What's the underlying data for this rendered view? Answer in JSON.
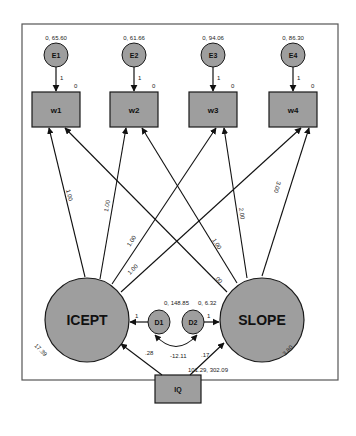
{
  "diagram": {
    "type": "structural-equation-model (latent growth curve)",
    "colors": {
      "node_fill": "#9e9e9e",
      "stroke": "#1a1a1a",
      "frame": "#555555",
      "background": "#ffffff"
    },
    "error_terms": [
      {
        "id": "E1",
        "label": "E1",
        "estimate": "0, 65.60",
        "path_label": "1",
        "intercept": "0"
      },
      {
        "id": "E2",
        "label": "E2",
        "estimate": "0, 61.66",
        "path_label": "1",
        "intercept": "0"
      },
      {
        "id": "E3",
        "label": "E3",
        "estimate": "0, 94.06",
        "path_label": "1",
        "intercept": "0"
      },
      {
        "id": "E4",
        "label": "E4",
        "estimate": "0, 86.30",
        "path_label": "1",
        "intercept": "0"
      }
    ],
    "observed": [
      {
        "id": "w1",
        "label": "w1"
      },
      {
        "id": "w2",
        "label": "w2"
      },
      {
        "id": "w3",
        "label": "w3"
      },
      {
        "id": "w4",
        "label": "w4"
      }
    ],
    "latent": {
      "icept": {
        "label": "ICEPT",
        "intercept": "17.39"
      },
      "slope": {
        "label": "SLOPE",
        "intercept": "3.80"
      }
    },
    "loadings": {
      "icept_w1": "1.00",
      "icept_w2": "1.00",
      "icept_w3": "1.00",
      "icept_w4": "1.00",
      "slope_w1": ".00",
      "slope_w2": "1.00",
      "slope_w3": "2.00",
      "slope_w4": "3.00"
    },
    "disturbances": {
      "d1": {
        "label": "D1",
        "estimate": "0, 148.85",
        "path_label": "1"
      },
      "d2": {
        "label": "D2",
        "estimate": "0, 6.32",
        "path_label": "1"
      },
      "covariance": "-12.11"
    },
    "predictor": {
      "label": "IQ",
      "estimate": "101.29, 302.09",
      "to_icept": ".28",
      "to_slope": ".17"
    }
  }
}
